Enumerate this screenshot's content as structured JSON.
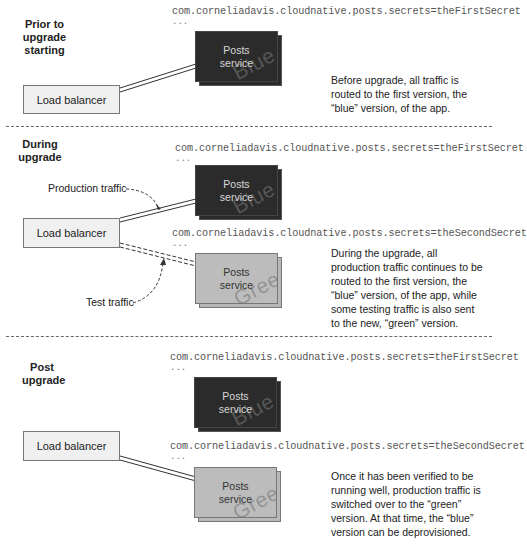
{
  "phases": [
    {
      "id": "prior",
      "label_lines": [
        "Prior to",
        "upgrade",
        "starting"
      ],
      "load_balancer": {
        "label": "Load balancer"
      },
      "services": [
        {
          "property": "com.corneliadavis.cloudnative.posts.secrets=theFirstSecret",
          "ellipsis": "...",
          "label_lines": [
            "Posts",
            "service"
          ],
          "version": "Blue",
          "color": "#2b2b2b"
        }
      ],
      "description": [
        "Before upgrade, all traffic is",
        "routed to the first version, the",
        "“blue” version, of the app."
      ]
    },
    {
      "id": "during",
      "label_lines": [
        "During",
        "upgrade"
      ],
      "load_balancer": {
        "label": "Load balancer"
      },
      "annotations": {
        "production": "Production traffic",
        "test": "Test traffic"
      },
      "services": [
        {
          "property": "com.corneliadavis.cloudnative.posts.secrets=theFirstSecret",
          "ellipsis": "...",
          "label_lines": [
            "Posts",
            "service"
          ],
          "version": "Blue",
          "color": "#2b2b2b"
        },
        {
          "property": "com.corneliadavis.cloudnative.posts.secrets=theSecondSecret",
          "ellipsis": "...",
          "label_lines": [
            "Posts",
            "service"
          ],
          "version": "Green",
          "color": "#bcbcbc"
        }
      ],
      "description": [
        "During the upgrade, all",
        "production traffic continues to be",
        "routed to the first version, the",
        "“blue” version, of the app, while",
        "some testing traffic is also sent",
        "to the new, “green” version."
      ]
    },
    {
      "id": "post",
      "label_lines": [
        "Post",
        "upgrade"
      ],
      "load_balancer": {
        "label": "Load balancer"
      },
      "services": [
        {
          "property": "com.corneliadavis.cloudnative.posts.secrets=theFirstSecret",
          "ellipsis": "...",
          "label_lines": [
            "Posts",
            "service"
          ],
          "version": "Blue",
          "color": "#2b2b2b"
        },
        {
          "property": "com.corneliadavis.cloudnative.posts.secrets=theSecondSecret",
          "ellipsis": "...",
          "label_lines": [
            "Posts",
            "service"
          ],
          "version": "Green",
          "color": "#bcbcbc"
        }
      ],
      "description": [
        "Once it has been verified to be",
        "running well, production traffic is",
        "switched over to the “green”",
        "version. At that time, the “blue”",
        "version can be deprovisioned."
      ]
    }
  ]
}
